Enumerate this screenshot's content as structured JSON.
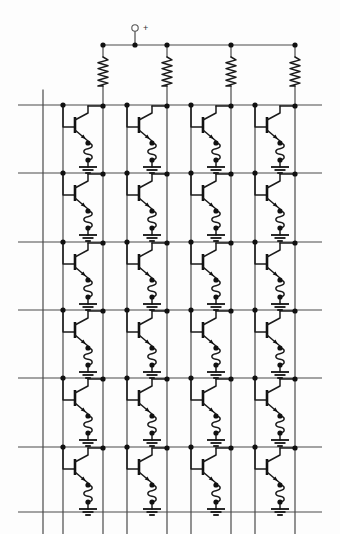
{
  "diagram": {
    "kind": "circuit-schematic",
    "supply_terminal_label": "+",
    "columns": 4,
    "rows": 6,
    "background_color": "#fdfdfd",
    "wire_color": "#3a3a3a",
    "device_color": "#1a1a1a",
    "node_color": "#111111"
  },
  "geometry": {
    "width": 340,
    "height": 534,
    "supply_rail_y": 45,
    "supply_rail_x_start": 103,
    "supply_rail_x_end": 295,
    "supply_terminal_x": 135,
    "supply_terminal_y": 28,
    "supply_terminal_radius": 3.2,
    "row_rail_x_start": 18,
    "row_rail_x_end": 322,
    "row_y": [
      105,
      173,
      242,
      310,
      378,
      447
    ],
    "bottom_rail_y": 512,
    "column_collector_x": [
      103,
      167,
      231,
      295
    ],
    "column_base_x": [
      63,
      127,
      191,
      255
    ],
    "left_column_line_x": 43,
    "column_line_top_y": 90,
    "column_line_bottom_y": 534,
    "resistor_top_y": 57,
    "resistor_bottom_y": 86,
    "resistor_peaks": 5,
    "resistor_amplitude": 5,
    "node_radius": 2.6
  },
  "elements": {
    "supply_terminal": "supply-terminal",
    "supply_rail": "supply-rail",
    "resistor": "pull-up-resistor",
    "transistor": "bjt-transistor",
    "inductor": "emitter-coil",
    "ground": "ground-symbol",
    "row_line": "row-select-line",
    "column_line": "column-line",
    "junction": "junction-dot"
  },
  "labels": {
    "supply_plus": "+"
  }
}
